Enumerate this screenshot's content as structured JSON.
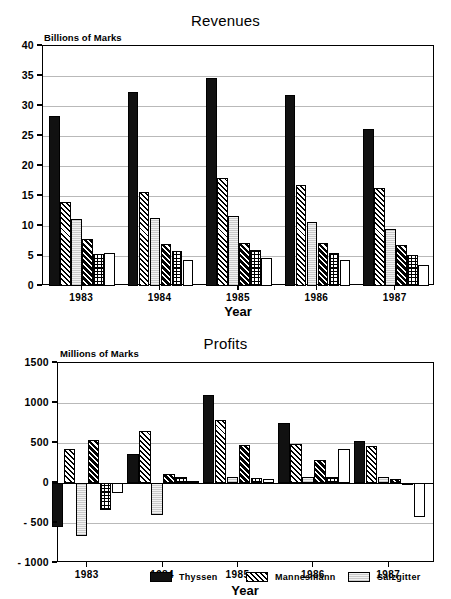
{
  "charts": {
    "revenues": {
      "title": "Revenues",
      "unit_label": "Billions of Marks",
      "xlabel": "Year"
    },
    "profits": {
      "title": "Profits",
      "unit_label": "Millions of Marks",
      "xlabel": "Year"
    }
  },
  "legend": {
    "position": "bottom",
    "entries": [
      {
        "label": "Thyssen",
        "pattern": "p-solid"
      },
      {
        "label": "Mannesmann",
        "pattern": "p-hatch"
      },
      {
        "label": "Salzgitter",
        "pattern": "p-light"
      }
    ]
  },
  "chart_data": [
    {
      "type": "bar",
      "title": "Revenues",
      "xlabel": "Year",
      "ylabel": "Billions of Marks",
      "ylim": [
        0,
        40
      ],
      "yticks": [
        0,
        5,
        10,
        15,
        20,
        25,
        30,
        35,
        40
      ],
      "grid": true,
      "legend_position": "bottom",
      "categories": [
        "1983",
        "1984",
        "1985",
        "1986",
        "1987"
      ],
      "series": [
        {
          "name": "Thyssen",
          "pattern": "p-solid",
          "values": [
            28.4,
            32.3,
            34.6,
            31.8,
            26.2
          ]
        },
        {
          "name": "Mannesmann",
          "pattern": "p-hatch",
          "values": [
            14.0,
            15.6,
            18.0,
            16.9,
            16.3
          ]
        },
        {
          "name": "Salzgitter",
          "pattern": "p-light",
          "values": [
            11.2,
            11.3,
            11.6,
            10.6,
            9.5
          ]
        },
        {
          "name": "Series 4",
          "pattern": "p-dhatch",
          "values": [
            7.9,
            7.0,
            7.2,
            7.1,
            6.9
          ]
        },
        {
          "name": "Series 5",
          "pattern": "p-grid",
          "values": [
            5.4,
            5.8,
            6.0,
            5.5,
            5.1
          ]
        },
        {
          "name": "Series 6",
          "pattern": "p-white",
          "values": [
            5.5,
            4.3,
            4.7,
            4.3,
            3.5
          ]
        }
      ]
    },
    {
      "type": "bar",
      "title": "Profits",
      "xlabel": "Year",
      "ylabel": "Millions of Marks",
      "ylim": [
        -1000,
        1500
      ],
      "yticks": [
        -1000,
        -500,
        0,
        500,
        1000,
        1500
      ],
      "ytick_labels": [
        "- 1000",
        "- 500",
        "0",
        "500",
        "1000",
        "1500"
      ],
      "grid": true,
      "legend_position": "bottom",
      "categories": [
        "1983",
        "1984",
        "1985",
        "1986",
        "1987"
      ],
      "series": [
        {
          "name": "Thyssen",
          "pattern": "p-solid",
          "values": [
            -550,
            360,
            1100,
            750,
            520
          ]
        },
        {
          "name": "Mannesmann",
          "pattern": "p-hatch",
          "values": [
            420,
            650,
            790,
            490,
            460
          ]
        },
        {
          "name": "Salzgitter",
          "pattern": "p-light",
          "values": [
            -660,
            -400,
            80,
            80,
            80
          ]
        },
        {
          "name": "Series 4",
          "pattern": "p-dhatch",
          "values": [
            540,
            110,
            480,
            290,
            50
          ]
        },
        {
          "name": "Series 5",
          "pattern": "p-grid",
          "values": [
            -340,
            70,
            60,
            70,
            -10
          ]
        },
        {
          "name": "Series 6",
          "pattern": "p-white",
          "values": [
            -120,
            20,
            50,
            420,
            -420
          ]
        }
      ]
    }
  ]
}
